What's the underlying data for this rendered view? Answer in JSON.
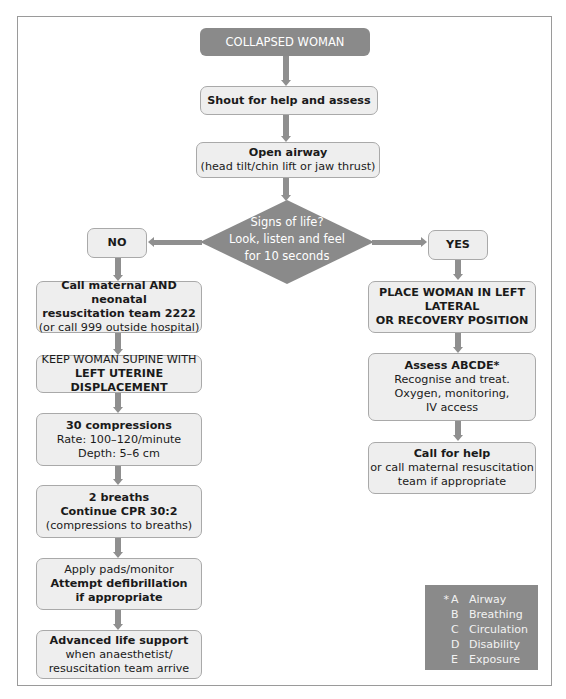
{
  "flowchart": {
    "start": "COLLAPSED WOMAN",
    "step_shout": "Shout for help and assess",
    "step_airway": {
      "title": "Open airway",
      "detail": "(head tilt/chin lift or jaw thrust)"
    },
    "decision": {
      "line1": "Signs of life?",
      "line2": "Look, listen and feel",
      "line3": "for 10 seconds"
    },
    "no_label": "NO",
    "yes_label": "YES",
    "no_branch": {
      "call_team": {
        "line1": "Call maternal AND neonatal",
        "line2": "resuscitation team 2222",
        "line3": "(or call 999 outside hospital)"
      },
      "supine": {
        "line1": "KEEP WOMAN SUPINE WITH",
        "line2": "LEFT UTERINE DISPLACEMENT"
      },
      "compressions": {
        "title": "30 compressions",
        "rate": "Rate: 100–120/minute",
        "depth": "Depth: 5–6 cm"
      },
      "breaths": {
        "title": "2 breaths",
        "line2": "Continue CPR 30:2",
        "line3": "(compressions to breaths)"
      },
      "defib": {
        "line1": "Apply pads/monitor",
        "line2": "Attempt defibrillation",
        "line3": "if appropriate"
      },
      "als": {
        "title": "Advanced life support",
        "line2": "when anaesthetist/",
        "line3": "resuscitation team arrive"
      }
    },
    "yes_branch": {
      "position": {
        "line1": "PLACE WOMAN IN LEFT",
        "line2": "LATERAL",
        "line3": "OR RECOVERY POSITION"
      },
      "assess": {
        "title": "Assess ABCDE*",
        "line2": "Recognise and treat.",
        "line3": "Oxygen, monitoring,",
        "line4": "IV access"
      },
      "call_help": {
        "title": "Call for help",
        "line2": "or call maternal resuscitation",
        "line3": "team if appropriate"
      }
    },
    "legend": {
      "marker": "*",
      "items": [
        {
          "letter": "A",
          "label": "Airway"
        },
        {
          "letter": "B",
          "label": "Breathing"
        },
        {
          "letter": "C",
          "label": "Circulation"
        },
        {
          "letter": "D",
          "label": "Disability"
        },
        {
          "letter": "E",
          "label": "Exposure"
        }
      ]
    },
    "colors": {
      "dark_fill": "#8a8a8a",
      "box_fill": "#eeeeee",
      "arrow": "#8f8f8f",
      "frame": "#9a9a9a"
    }
  }
}
